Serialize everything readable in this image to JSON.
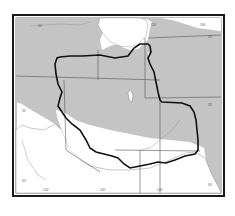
{
  "map": {
    "type": "outline range map",
    "colors": {
      "land": "#c4c4c4",
      "water": "#ffffff",
      "frame": "#1a1a1a",
      "range_boundary": "#111111",
      "state_lines": "#555555"
    },
    "labels": {
      "top_lon_1": "110°",
      "top_lon_2": "100°",
      "right_lat_1": "40°",
      "right_lat_2": "35°",
      "right_lat_3": "30°",
      "left_lat_1": "40°",
      "left_lat_2": "35°",
      "left_lat_3": "30°",
      "bottom_lon_1": "120°",
      "bottom_lon_2": "110°",
      "bottom_lon_3": "100°"
    }
  }
}
